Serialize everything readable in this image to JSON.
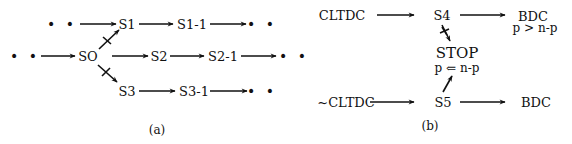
{
  "panel_a": {
    "caption": "(a)",
    "nodes": {
      "dots_r1_start": "• •",
      "s1": "S1",
      "s1_1": "S1-1",
      "dots_r1_end": "• •",
      "dots_r2_start": "• •",
      "so": "SO",
      "s2": "S2",
      "s2_1": "S2-1",
      "dots_r2_end": "• •",
      "s3": "S3",
      "s3_1": "S3-1",
      "dots_r3_end": "• •"
    },
    "edges": [
      {
        "from": "• •",
        "to": "S1",
        "crossed": false
      },
      {
        "from": "S1",
        "to": "S1-1",
        "crossed": false
      },
      {
        "from": "S1-1",
        "to": "• •",
        "crossed": false
      },
      {
        "from": "• •",
        "to": "SO",
        "crossed": false
      },
      {
        "from": "SO",
        "to": "S1",
        "crossed": true
      },
      {
        "from": "SO",
        "to": "S2",
        "crossed": false
      },
      {
        "from": "SO",
        "to": "S3",
        "crossed": true
      },
      {
        "from": "S2",
        "to": "S2-1",
        "crossed": false
      },
      {
        "from": "S2-1",
        "to": "• •",
        "crossed": false
      },
      {
        "from": "S3",
        "to": "S3-1",
        "crossed": false
      },
      {
        "from": "S3-1",
        "to": "• •",
        "crossed": false
      }
    ]
  },
  "panel_b": {
    "caption": "(b)",
    "nodes": {
      "cltdc": "CLTDC",
      "s4": "S4",
      "bdc_top": "BDC",
      "bdc_top_condition": "p > n-p",
      "stop": "STOP",
      "stop_condition": "p ⇐ n-p",
      "not_cltdc": "~CLTDC",
      "s5": "S5",
      "bdc_bottom": "BDC"
    },
    "edges": [
      {
        "from": "CLTDC",
        "to": "S4",
        "crossed": false
      },
      {
        "from": "S4",
        "to": "BDC",
        "crossed": false
      },
      {
        "from": "S4",
        "to": "STOP",
        "crossed": true
      },
      {
        "from": "~CLTDC",
        "to": "S5",
        "crossed": false
      },
      {
        "from": "S5",
        "to": "BDC",
        "crossed": false
      },
      {
        "from": "S5",
        "to": "STOP",
        "crossed": false
      }
    ]
  },
  "colors": {
    "ink": "#111111",
    "background": "#ffffff"
  }
}
